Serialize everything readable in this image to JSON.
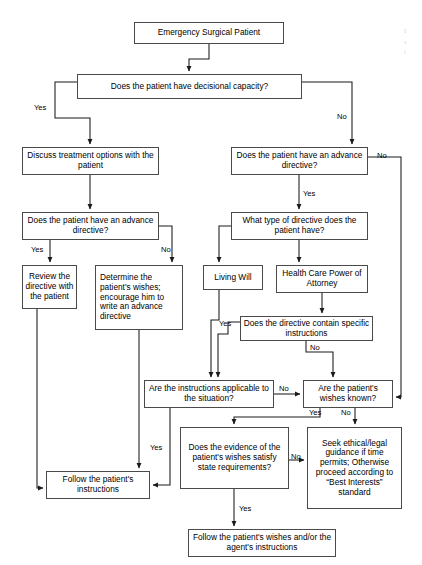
{
  "figure": {
    "width": 422,
    "height": 565,
    "background": "#ffffff",
    "box_border_color": "#4a4a4a",
    "line_color": "#1a1a1a",
    "text_color": "#000000"
  },
  "nodes": [
    {
      "id": "start",
      "label": "Emergency Surgical Patient",
      "x": 134,
      "y": 22,
      "w": 150,
      "h": 22
    },
    {
      "id": "capacity",
      "label": "Does the patient have decisional capacity?",
      "x": 77,
      "y": 74,
      "w": 225,
      "h": 25
    },
    {
      "id": "discuss",
      "label": "Discuss treatment options with the patient",
      "x": 22,
      "y": 147,
      "w": 137,
      "h": 28
    },
    {
      "id": "ad_left",
      "label": "Does the patient have an advance directive?",
      "x": 22,
      "y": 212,
      "w": 137,
      "h": 28
    },
    {
      "id": "review",
      "label": "Review the directive with the patient",
      "x": 22,
      "y": 265,
      "w": 55,
      "h": 44
    },
    {
      "id": "determine",
      "label": "Determine the patient's wishes; encourage him to write an advance directive",
      "x": 95,
      "y": 265,
      "w": 88,
      "h": 65
    },
    {
      "id": "ad_right",
      "label": "Does the patient have an advance directive?",
      "x": 231,
      "y": 147,
      "w": 137,
      "h": 28
    },
    {
      "id": "type",
      "label": "What type of directive does the patient have?",
      "x": 231,
      "y": 212,
      "w": 137,
      "h": 28
    },
    {
      "id": "living_will",
      "label": "Living Will",
      "x": 203,
      "y": 265,
      "w": 60,
      "h": 25
    },
    {
      "id": "hcpoa",
      "label": "Health Care Power of Attorney",
      "x": 276,
      "y": 265,
      "w": 92,
      "h": 28
    },
    {
      "id": "specific",
      "label": "Does the directive contain specific instructions",
      "x": 240,
      "y": 316,
      "w": 133,
      "h": 25
    },
    {
      "id": "applicable",
      "label": "Are the instructions applicable to the situation?",
      "x": 144,
      "y": 380,
      "w": 130,
      "h": 28
    },
    {
      "id": "wishes_known",
      "label": "Are the patient's wishes known?",
      "x": 303,
      "y": 380,
      "w": 90,
      "h": 28
    },
    {
      "id": "evidence",
      "label": "Does the evidence of the patient's wishes satisfy state requirements?",
      "x": 180,
      "y": 427,
      "w": 109,
      "h": 62
    },
    {
      "id": "seek",
      "label": "Seek ethical/legal guidance if time permits; Otherwise proceed according to “Best Interests” standard",
      "x": 307,
      "y": 427,
      "w": 95,
      "h": 82
    },
    {
      "id": "follow_instr",
      "label": "Follow the patient's instructions",
      "x": 46,
      "y": 471,
      "w": 104,
      "h": 28
    },
    {
      "id": "follow_wishes",
      "label": "Follow the patient's wishes and/or the agent's instructions",
      "x": 188,
      "y": 529,
      "w": 148,
      "h": 28
    }
  ],
  "edge_labels": [
    {
      "id": "cap-yes",
      "text": "Yes",
      "x": 34,
      "y": 104
    },
    {
      "id": "cap-no",
      "text": "No",
      "x": 337,
      "y": 113
    },
    {
      "id": "adleft-yes",
      "text": "Yes",
      "x": 31,
      "y": 246
    },
    {
      "id": "adleft-no",
      "text": "No",
      "x": 161,
      "y": 246
    },
    {
      "id": "adright-no",
      "text": "No",
      "x": 377,
      "y": 152
    },
    {
      "id": "adright-yes",
      "text": "Yes",
      "x": 303,
      "y": 190
    },
    {
      "id": "specific-yes",
      "text": "Yes",
      "x": 219,
      "y": 320
    },
    {
      "id": "specific-no",
      "text": "No",
      "x": 310,
      "y": 348
    },
    {
      "id": "applicable-no",
      "text": "No",
      "x": 279,
      "y": 385
    },
    {
      "id": "applicable-yes",
      "text": "Yes",
      "x": 150,
      "y": 444
    },
    {
      "id": "known-yes",
      "text": "Yes",
      "x": 311,
      "y": 410
    },
    {
      "id": "known-no",
      "text": "No",
      "x": 344,
      "y": 410
    },
    {
      "id": "evidence-no",
      "text": "No",
      "x": 292,
      "y": 455
    },
    {
      "id": "evidence-yes",
      "text": "Yes",
      "x": 239,
      "y": 507
    }
  ],
  "margin_marks": [
    {
      "id": "margin-artifact",
      "text": "I\ns\nt",
      "x": 404,
      "y": 26
    }
  ]
}
